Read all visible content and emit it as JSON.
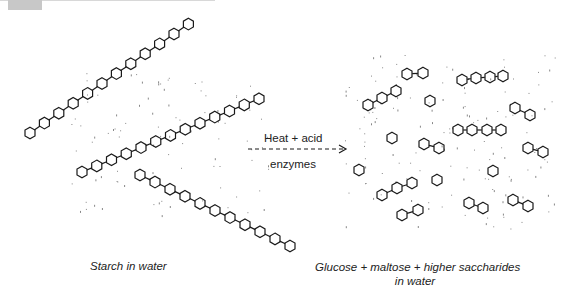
{
  "header": {
    "tab_color": "#c8c8c8"
  },
  "reaction": {
    "above_arrow": "Heat + acid",
    "below_arrow": "enzymes",
    "arrow_style": "dashed"
  },
  "captions": {
    "left": "Starch in water",
    "right_line1": "Glucose + maltose + higher saccharides",
    "right_line2": "in water"
  },
  "left_panel": {
    "description": "Long starch chains of linked glucose rings",
    "chains": [
      {
        "start": [
          30,
          133
        ],
        "step": [
          14.4,
          -9.9
        ],
        "count": 12
      },
      {
        "start": [
          82,
          172
        ],
        "step": [
          14.75,
          -6.1
        ],
        "count": 13
      },
      {
        "start": [
          140,
          175
        ],
        "step": [
          15,
          7.1
        ],
        "count": 11
      }
    ]
  },
  "right_panel": {
    "description": "Short fragments: glucose singles, maltose pairs, higher saccharides",
    "fragments": [
      {
        "rings": [
          [
            407,
            74
          ],
          [
            423,
            73
          ]
        ]
      },
      {
        "rings": [
          [
            368,
            105
          ],
          [
            382,
            98
          ],
          [
            396,
            91
          ]
        ]
      },
      {
        "rings": [
          [
            430,
            101
          ]
        ]
      },
      {
        "rings": [
          [
            462,
            80
          ],
          [
            476,
            78
          ],
          [
            490,
            77
          ],
          [
            503,
            76
          ]
        ]
      },
      {
        "rings": [
          [
            515,
            108
          ],
          [
            530,
            115
          ]
        ]
      },
      {
        "rings": [
          [
            458,
            130
          ],
          [
            472,
            130
          ],
          [
            487,
            130
          ],
          [
            501,
            130
          ]
        ]
      },
      {
        "rings": [
          [
            528,
            148
          ],
          [
            543,
            152
          ]
        ]
      },
      {
        "rings": [
          [
            392,
            138
          ]
        ]
      },
      {
        "rings": [
          [
            424,
            144
          ],
          [
            439,
            148
          ]
        ]
      },
      {
        "rings": [
          [
            359,
            170
          ]
        ]
      },
      {
        "rings": [
          [
            437,
            180
          ]
        ]
      },
      {
        "rings": [
          [
            493,
            171
          ]
        ]
      },
      {
        "rings": [
          [
            382,
            195
          ],
          [
            397,
            188
          ],
          [
            412,
            183
          ]
        ]
      },
      {
        "rings": [
          [
            402,
            215
          ],
          [
            418,
            210
          ]
        ]
      },
      {
        "rings": [
          [
            469,
            203
          ],
          [
            483,
            208
          ]
        ]
      },
      {
        "rings": [
          [
            513,
            200
          ],
          [
            528,
            206
          ]
        ]
      }
    ]
  },
  "colors": {
    "stroke": "#1a1a1a",
    "dots": "#888888",
    "background": "#ffffff"
  }
}
